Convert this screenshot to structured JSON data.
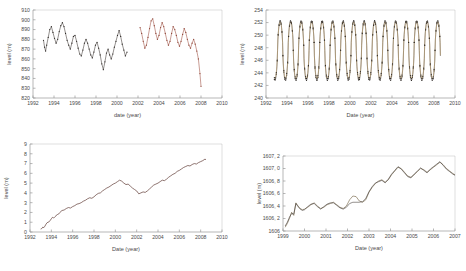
{
  "figure": {
    "panel_count": 4,
    "background": "#ffffff",
    "colors": {
      "axis": "#9a9a9a",
      "text": "#4a4a4a",
      "series_dark": "#3a3330",
      "series_red": "#9c4b3c",
      "series_tan": "#b99a63",
      "series_olive": "#6b5a3a",
      "series_maroon": "#5e3a33"
    }
  },
  "chart_data": [
    {
      "id": "panel-top-left",
      "type": "line",
      "title": "",
      "xlabel": "date (year)",
      "ylabel": "level (m)",
      "xlim": [
        1992,
        2010
      ],
      "ylim": [
        820,
        910
      ],
      "xticks": [
        1992,
        1994,
        1996,
        1998,
        2000,
        2002,
        2004,
        2006,
        2008,
        2010
      ],
      "yticks": [
        820,
        830,
        840,
        850,
        860,
        870,
        880,
        890,
        900,
        910
      ],
      "grid": false,
      "legend": "none",
      "markers": true,
      "series": [
        {
          "name": "observed-1993-2001",
          "color": "#3a3330",
          "x": [
            1993.0,
            1993.1,
            1993.2,
            1993.3,
            1993.45,
            1993.6,
            1993.75,
            1993.9,
            1994.05,
            1994.2,
            1994.35,
            1994.5,
            1994.65,
            1994.8,
            1994.95,
            1995.1,
            1995.25,
            1995.4,
            1995.55,
            1995.7,
            1995.85,
            1996.0,
            1996.15,
            1996.3,
            1996.45,
            1996.6,
            1996.75,
            1996.9,
            1997.05,
            1997.2,
            1997.35,
            1997.5,
            1997.65,
            1997.8,
            1997.95,
            1998.1,
            1998.25,
            1998.4,
            1998.55,
            1998.7,
            1998.85,
            1999.0,
            1999.15,
            1999.3,
            1999.45,
            1999.6,
            1999.75,
            1999.9,
            2000.05,
            2000.2,
            2000.35,
            2000.5,
            2000.65,
            2000.8,
            2000.95
          ],
          "y": [
            879,
            872,
            868,
            874,
            882,
            890,
            893,
            887,
            881,
            876,
            880,
            888,
            894,
            897,
            893,
            886,
            879,
            874,
            870,
            876,
            883,
            884,
            878,
            871,
            865,
            863,
            869,
            876,
            880,
            876,
            870,
            864,
            861,
            867,
            874,
            877,
            871,
            864,
            855,
            849,
            857,
            866,
            870,
            864,
            860,
            865,
            872,
            878,
            884,
            889,
            883,
            875,
            869,
            863,
            867
          ]
        },
        {
          "name": "observed-2002-2008",
          "color": "#9c4b3c",
          "x": [
            2002.2,
            2002.35,
            2002.5,
            2002.65,
            2002.8,
            2002.95,
            2003.1,
            2003.25,
            2003.4,
            2003.55,
            2003.7,
            2003.85,
            2004.0,
            2004.15,
            2004.3,
            2004.45,
            2004.6,
            2004.75,
            2004.9,
            2005.05,
            2005.2,
            2005.35,
            2005.5,
            2005.65,
            2005.8,
            2005.95,
            2006.1,
            2006.25,
            2006.4,
            2006.55,
            2006.7,
            2006.85,
            2007.0,
            2007.15,
            2007.3,
            2007.45,
            2007.6,
            2007.75,
            2007.9,
            2008.0
          ],
          "y": [
            892,
            886,
            878,
            871,
            874,
            882,
            891,
            899,
            901,
            894,
            886,
            880,
            884,
            892,
            897,
            893,
            886,
            879,
            874,
            878,
            886,
            893,
            890,
            884,
            877,
            873,
            878,
            885,
            891,
            887,
            880,
            874,
            871,
            876,
            880,
            875,
            868,
            860,
            845,
            832
          ]
        }
      ]
    },
    {
      "id": "panel-top-right",
      "type": "line",
      "title": "",
      "xlabel": "Date (year)",
      "ylabel": "level (m)",
      "xlim": [
        1992,
        2010
      ],
      "ylim": [
        240,
        254
      ],
      "xticks": [
        1992,
        1994,
        1996,
        1998,
        2000,
        2002,
        2004,
        2006,
        2008,
        2010
      ],
      "yticks": [
        240,
        242,
        244,
        246,
        248,
        250,
        252,
        254
      ],
      "grid": false,
      "legend": "none",
      "markers": true,
      "series": [
        {
          "name": "series-dark",
          "color": "#3a3330",
          "note": "seasonal oscillation, annual cycle amplitude ~8 m, peak ~252.3, trough ~242.5",
          "cycle": {
            "period_years": 1.0,
            "peak": 252.3,
            "trough": 242.8,
            "peak_phase": 0.35
          },
          "x_start": 1992.8,
          "x_end": 2008.6
        },
        {
          "name": "series-tan",
          "color": "#b99a63",
          "note": "near-identical overlay of dark series, slight offset",
          "cycle": {
            "period_years": 1.0,
            "peak": 252.1,
            "trough": 243.1,
            "peak_phase": 0.35
          },
          "x_start": 1992.8,
          "x_end": 2008.6
        }
      ]
    },
    {
      "id": "panel-bottom-left",
      "type": "line",
      "title": "",
      "xlabel": "Date (year)",
      "ylabel": "level (m)",
      "xlim": [
        1992,
        2010
      ],
      "ylim": [
        0,
        9
      ],
      "xticks": [
        1992,
        1994,
        1996,
        1998,
        2000,
        2002,
        2004,
        2006,
        2008,
        2010
      ],
      "yticks": [
        0,
        1,
        2,
        3,
        4,
        5,
        6,
        7,
        8,
        9
      ],
      "grid": false,
      "legend": "none",
      "markers": false,
      "series": [
        {
          "name": "cumulative-level",
          "color": "#5e3a33",
          "x": [
            1993.0,
            1993.1,
            1993.2,
            1993.3,
            1993.4,
            1993.5,
            1993.6,
            1993.7,
            1993.8,
            1993.9,
            1994.0,
            1994.1,
            1994.2,
            1994.3,
            1994.4,
            1994.5,
            1994.6,
            1994.7,
            1994.8,
            1994.9,
            1995.0,
            1995.2,
            1995.4,
            1995.6,
            1995.8,
            1996.0,
            1996.2,
            1996.4,
            1996.6,
            1996.8,
            1997.0,
            1997.2,
            1997.4,
            1997.6,
            1997.8,
            1998.0,
            1998.2,
            1998.4,
            1998.6,
            1998.8,
            1999.0,
            1999.2,
            1999.4,
            1999.6,
            1999.8,
            2000.0,
            2000.2,
            2000.4,
            2000.6,
            2000.8,
            2001.0,
            2001.2,
            2001.4,
            2001.6,
            2001.8,
            2002.0,
            2002.2,
            2002.4,
            2002.6,
            2002.8,
            2003.0,
            2003.2,
            2003.4,
            2003.6,
            2003.8,
            2004.0,
            2004.2,
            2004.4,
            2004.6,
            2004.8,
            2005.0,
            2005.2,
            2005.4,
            2005.6,
            2005.8,
            2006.0,
            2006.2,
            2006.4,
            2006.6,
            2006.8,
            2007.0,
            2007.2,
            2007.4,
            2007.6,
            2007.8,
            2008.0,
            2008.2,
            2008.4,
            2008.5
          ],
          "y": [
            0.3,
            0.35,
            0.5,
            0.45,
            0.6,
            0.8,
            0.95,
            1.0,
            1.05,
            1.2,
            1.35,
            1.5,
            1.45,
            1.5,
            1.6,
            1.75,
            1.8,
            1.85,
            2.0,
            2.1,
            2.2,
            2.25,
            2.4,
            2.5,
            2.45,
            2.6,
            2.7,
            2.85,
            2.9,
            3.0,
            3.15,
            3.25,
            3.4,
            3.5,
            3.45,
            3.6,
            3.8,
            3.95,
            4.0,
            4.2,
            4.35,
            4.5,
            4.6,
            4.75,
            4.9,
            5.0,
            5.15,
            5.3,
            5.2,
            5.0,
            4.85,
            4.9,
            4.7,
            4.5,
            4.35,
            4.2,
            3.9,
            4.0,
            4.1,
            4.05,
            4.2,
            4.4,
            4.6,
            4.8,
            4.9,
            5.0,
            5.15,
            5.3,
            5.25,
            5.4,
            5.6,
            5.75,
            5.9,
            6.0,
            6.2,
            6.3,
            6.45,
            6.6,
            6.7,
            6.8,
            6.75,
            6.9,
            7.0,
            6.95,
            7.1,
            7.2,
            7.3,
            7.45,
            7.4
          ]
        }
      ]
    },
    {
      "id": "panel-bottom-right",
      "type": "line",
      "title": "",
      "xlabel": "Date (year)",
      "ylabel": "level (m)",
      "xlim": [
        1999,
        2007
      ],
      "ylim": [
        1606.0,
        1607.2
      ],
      "xticks": [
        1999,
        2000,
        2001,
        2002,
        2003,
        2004,
        2005,
        2006,
        2007
      ],
      "yticks": [
        1606.0,
        1606.2,
        1606.4,
        1606.6,
        1606.8,
        1607.0,
        1607.2
      ],
      "ytick_labels": [
        "1606",
        "1606, 2",
        "1606, 4",
        "1606, 6",
        "1606, 8",
        "1607, 0",
        "1607, 2"
      ],
      "grid": false,
      "legend": "none",
      "markers": false,
      "series": [
        {
          "name": "series-a",
          "color": "#6b5a3a",
          "x": [
            1999.1,
            1999.2,
            1999.3,
            1999.4,
            1999.5,
            1999.6,
            1999.7,
            1999.8,
            1999.9,
            2000.0,
            2000.15,
            2000.3,
            2000.45,
            2000.6,
            2000.75,
            2000.9,
            2001.05,
            2001.2,
            2001.35,
            2001.5,
            2001.65,
            2001.8,
            2001.95,
            2002.1,
            2002.25,
            2002.4,
            2002.55,
            2002.7,
            2002.85,
            2003.0,
            2003.15,
            2003.3,
            2003.45,
            2003.6,
            2003.75,
            2003.9,
            2004.05,
            2004.2,
            2004.35,
            2004.5,
            2004.65,
            2004.8,
            2004.95,
            2005.1,
            2005.25,
            2005.4,
            2005.55,
            2005.7,
            2005.85,
            2006.0,
            2006.15,
            2006.3,
            2006.45,
            2006.6,
            2006.75,
            2006.9,
            2007.0
          ],
          "y": [
            1606.06,
            1606.12,
            1606.2,
            1606.3,
            1606.25,
            1606.45,
            1606.4,
            1606.36,
            1606.34,
            1606.35,
            1606.38,
            1606.42,
            1606.45,
            1606.4,
            1606.36,
            1606.38,
            1606.42,
            1606.44,
            1606.46,
            1606.42,
            1606.38,
            1606.36,
            1606.4,
            1606.5,
            1606.56,
            1606.55,
            1606.48,
            1606.46,
            1606.5,
            1606.62,
            1606.7,
            1606.76,
            1606.8,
            1606.82,
            1606.78,
            1606.82,
            1606.9,
            1606.96,
            1607.02,
            1607.0,
            1606.94,
            1606.88,
            1606.86,
            1606.9,
            1606.95,
            1607.0,
            1606.98,
            1606.94,
            1606.98,
            1607.02,
            1607.06,
            1607.1,
            1607.06,
            1607.0,
            1606.96,
            1606.92,
            1606.9
          ]
        },
        {
          "name": "series-b",
          "color": "#3a3330",
          "x": [
            1999.1,
            1999.2,
            1999.3,
            1999.4,
            1999.5,
            1999.6,
            1999.7,
            1999.8,
            1999.9,
            2000.0,
            2000.15,
            2000.3,
            2000.45,
            2000.6,
            2000.75,
            2000.9,
            2001.05,
            2001.2,
            2001.35,
            2001.5,
            2001.65,
            2001.8,
            2001.95,
            2002.1,
            2002.25,
            2002.4,
            2002.55,
            2002.7,
            2002.85,
            2003.0,
            2003.15,
            2003.3,
            2003.45,
            2003.6,
            2003.75,
            2003.9,
            2004.05,
            2004.2,
            2004.35,
            2004.5,
            2004.65,
            2004.8,
            2004.95,
            2005.1,
            2005.25,
            2005.4,
            2005.55,
            2005.7,
            2005.85,
            2006.0,
            2006.15,
            2006.3,
            2006.45,
            2006.6,
            2006.75,
            2006.9,
            2007.0
          ],
          "y": [
            1606.08,
            1606.14,
            1606.22,
            1606.28,
            1606.27,
            1606.44,
            1606.39,
            1606.35,
            1606.33,
            1606.34,
            1606.39,
            1606.43,
            1606.44,
            1606.39,
            1606.35,
            1606.39,
            1606.43,
            1606.45,
            1606.45,
            1606.41,
            1606.37,
            1606.35,
            1606.38,
            1606.44,
            1606.46,
            1606.46,
            1606.46,
            1606.47,
            1606.52,
            1606.63,
            1606.71,
            1606.77,
            1606.79,
            1606.81,
            1606.77,
            1606.83,
            1606.91,
            1606.97,
            1607.03,
            1606.99,
            1606.93,
            1606.87,
            1606.85,
            1606.91,
            1606.96,
            1607.01,
            1606.97,
            1606.93,
            1606.99,
            1607.03,
            1607.07,
            1607.11,
            1607.05,
            1606.99,
            1606.95,
            1606.91,
            1606.89
          ]
        }
      ]
    }
  ]
}
